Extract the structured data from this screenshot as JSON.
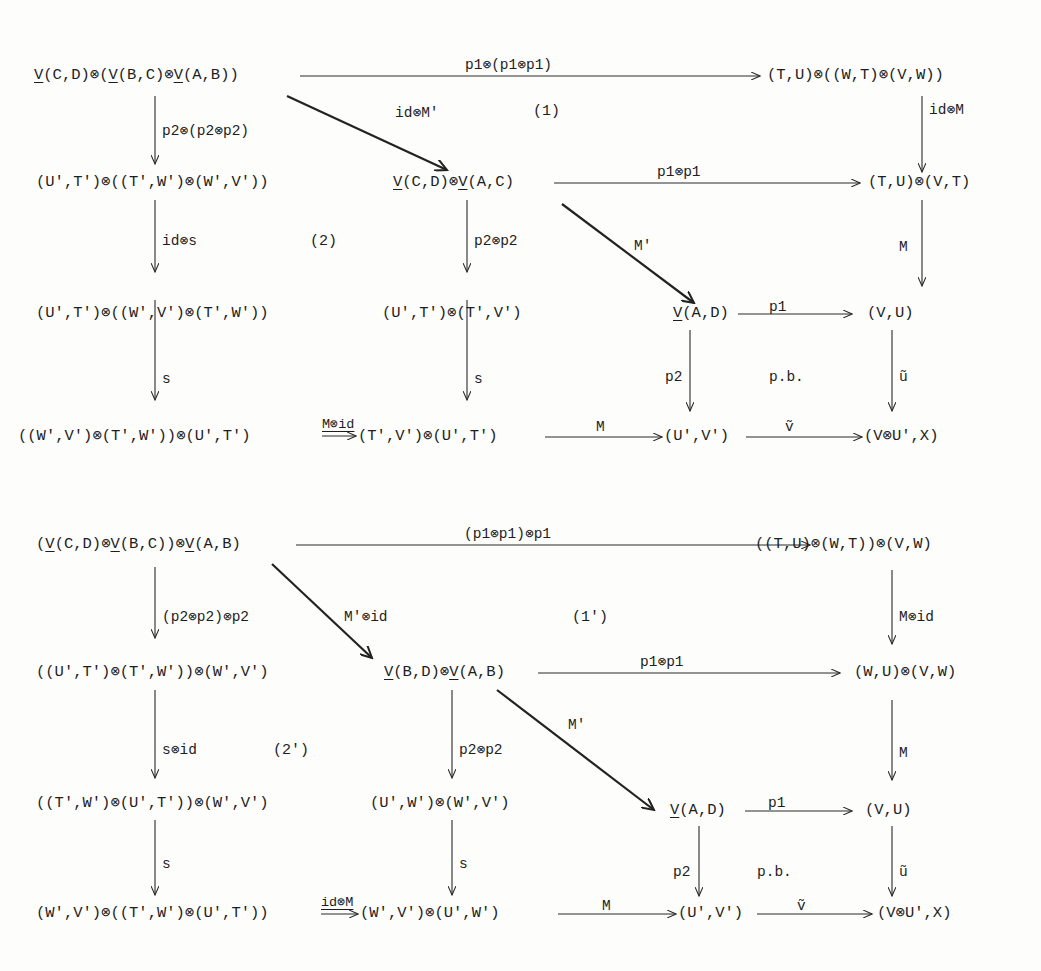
{
  "diagrams": [
    {
      "id": "top",
      "nodes": {
        "r1c1": {
          "pre": "",
          "V1": "V",
          "a": "(C,D)⊗(",
          "V2": "V",
          "b": "(B,C)⊗",
          "V3": "V",
          "c": "(A,B))"
        },
        "r1c4": "(T,U)⊗((W,T)⊗(V,W))",
        "r2c1": "(U',T')⊗((T',W')⊗(W',V'))",
        "r2c2": {
          "V1": "V",
          "a": "(C,D)⊗",
          "V2": "V",
          "b": "(A,C)"
        },
        "r2c4": "(T,U)⊗(V,T)",
        "r3c1": "(U',T')⊗((W',V')⊗(T',W'))",
        "r3c2": "(U',T')⊗(T',V')",
        "r3c3": {
          "V1": "V",
          "a": "(A,D)"
        },
        "r3c4": "(V,U)",
        "r4c1": "((W',V')⊗(T',W'))⊗(U',T')",
        "r4c2": "(T',V')⊗(U',T')",
        "r4c3": "(U',V')",
        "r4c4": "(V⊗U',X)"
      },
      "labels": {
        "top_h": "p1⊗(p1⊗p1)",
        "diag1": "id⊗M'",
        "region1": "(1)",
        "right_v1": "id⊗M",
        "left_v1": "p2⊗(p2⊗p2)",
        "mid_h": "p1⊗p1",
        "left_v2": "id⊗s",
        "region2": "(2)",
        "mid_v2": "p2⊗p2",
        "diag2": "M'",
        "right_v2": "M",
        "pb_h": "p1",
        "left_v3": "s",
        "mid_v3": "s",
        "pb_v": "p2",
        "pb_mark": "p.b.",
        "u_tilde": "ũ",
        "bot_h1": "M⊗id",
        "bot_h2": "M",
        "bot_h3": "ṽ"
      }
    },
    {
      "id": "bottom",
      "nodes": {
        "r1c1": {
          "pre": "(",
          "V1": "V",
          "a": "(C,D)⊗",
          "V2": "V",
          "b": "(B,C))⊗",
          "V3": "V",
          "c": "(A,B)"
        },
        "r1c4": "((T,U)⊗(W,T))⊗(V,W)",
        "r2c1": "((U',T')⊗(T',W'))⊗(W',V')",
        "r2c2": {
          "V1": "V",
          "a": "(B,D)⊗",
          "V2": "V",
          "b": "(A,B)"
        },
        "r2c4": "(W,U)⊗(V,W)",
        "r3c1": "((T',W')⊗(U',T'))⊗(W',V')",
        "r3c2": "(U',W')⊗(W',V')",
        "r3c3": {
          "V1": "V",
          "a": "(A,D)"
        },
        "r3c4": "(V,U)",
        "r4c1": "(W',V')⊗((T',W')⊗(U',T'))",
        "r4c2": "(W',V')⊗(U',W')",
        "r4c3": "(U',V')",
        "r4c4": "(V⊗U',X)"
      },
      "labels": {
        "top_h": "(p1⊗p1)⊗p1",
        "diag1": "M'⊗id",
        "region1": "(1')",
        "right_v1": "M⊗id",
        "left_v1": "(p2⊗p2)⊗p2",
        "mid_h": "p1⊗p1",
        "left_v2": "s⊗id",
        "region2": "(2')",
        "mid_v2": "p2⊗p2",
        "diag2": "M'",
        "right_v2": "M",
        "pb_h": "p1",
        "left_v3": "s",
        "mid_v3": "s",
        "pb_v": "p2",
        "pb_mark": "p.b.",
        "u_tilde": "ũ",
        "bot_h1": "id⊗M",
        "bot_h2": "M",
        "bot_h3": "ṽ"
      }
    }
  ]
}
